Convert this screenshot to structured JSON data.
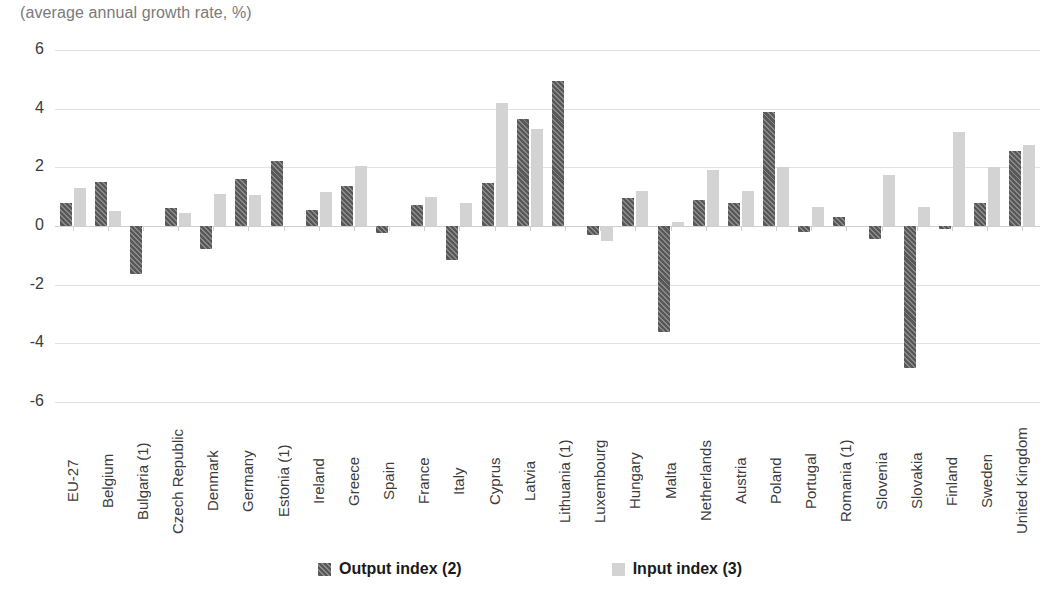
{
  "subtitle": "(average annual growth rate, %)",
  "legend": {
    "position": "bottom-center",
    "items": [
      {
        "label": "Output index (2)",
        "color": "#585858",
        "pattern": "diagonal-hatch"
      },
      {
        "label": "Input index (3)",
        "color": "#d3d3d3",
        "pattern": "solid"
      }
    ]
  },
  "axis": {
    "yticks": [
      "6",
      "4",
      "2",
      "0",
      "-2",
      "-4",
      "-6"
    ]
  },
  "chart_data": {
    "type": "bar",
    "title": "",
    "subtitle": "(average annual growth rate, %)",
    "xlabel": "",
    "ylabel": "",
    "ylim": [
      -6,
      6
    ],
    "ytick_step": 2,
    "grid": true,
    "legend_position": "bottom-center",
    "categories": [
      "EU-27",
      "Belgium",
      "Bulgaria (1)",
      "Czech Republic",
      "Denmark",
      "Germany",
      "Estonia (1)",
      "Ireland",
      "Greece",
      "Spain",
      "France",
      "Italy",
      "Cyprus",
      "Latvia",
      "Lithuania (1)",
      "Luxembourg",
      "Hungary",
      "Malta",
      "Netherlands",
      "Austria",
      "Poland",
      "Portugal",
      "Romania (1)",
      "Slovenia",
      "Slovakia",
      "Finland",
      "Sweden",
      "United Kingdom"
    ],
    "series": [
      {
        "name": "Output index (2)",
        "color": "#585858",
        "values": [
          0.8,
          1.5,
          -1.65,
          0.6,
          -0.8,
          1.6,
          2.2,
          0.55,
          1.35,
          -0.25,
          0.7,
          -1.15,
          1.45,
          3.65,
          4.95,
          -0.3,
          0.95,
          -3.6,
          0.9,
          0.8,
          3.9,
          -0.2,
          0.3,
          -0.45,
          -4.85,
          -0.1,
          0.8,
          2.55
        ]
      },
      {
        "name": "Input index (3)",
        "color": "#d3d3d3",
        "values": [
          1.3,
          0.5,
          0.0,
          0.45,
          1.1,
          1.05,
          0.0,
          1.15,
          2.05,
          -0.05,
          1.0,
          0.8,
          4.2,
          3.3,
          0.0,
          -0.5,
          1.2,
          0.15,
          1.9,
          1.2,
          2.0,
          0.65,
          0.0,
          1.75,
          0.65,
          3.2,
          2.0,
          2.75
        ]
      }
    ]
  }
}
